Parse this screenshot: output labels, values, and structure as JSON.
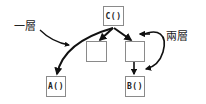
{
  "diagram": {
    "nodes": {
      "c": {
        "label": "C()"
      },
      "mid_left": {
        "label": ""
      },
      "mid_right": {
        "label": ""
      },
      "a": {
        "label": "A()"
      },
      "b": {
        "label": "B()"
      }
    },
    "annotations": {
      "one_level": "一層",
      "two_levels": "兩層"
    },
    "edges": [
      {
        "from": "C()",
        "to": "A()"
      },
      {
        "from": "C()",
        "to": "mid_left"
      },
      {
        "from": "C()",
        "to": "mid_right"
      },
      {
        "from": "mid_right",
        "to": "B()"
      }
    ],
    "colors": {
      "stroke": "#111111",
      "box_border": "#8a8a8a"
    }
  }
}
